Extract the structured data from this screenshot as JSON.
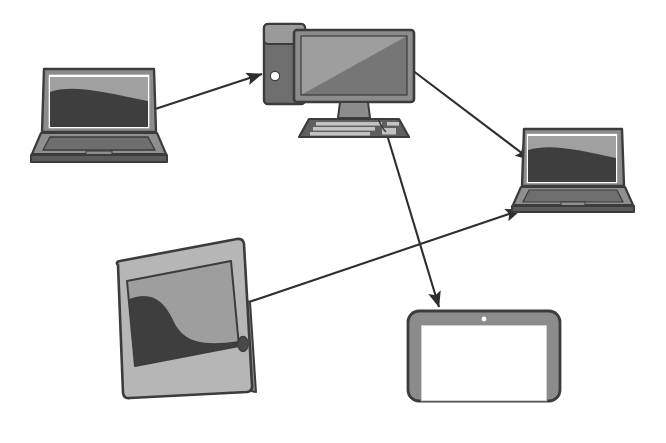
{
  "canvas": {
    "width": 666,
    "height": 443,
    "background": "#ffffff",
    "title": "Device connection diagram"
  },
  "palette": {
    "outline": "#3c3c3c",
    "arrow": "#2e2e2e",
    "bezel_gray": "#8c8c8c",
    "bezel_light": "#b6b6b6",
    "screen_light": "#9e9e9e",
    "screen_dark": "#3e3e3e",
    "screen_blank": "#ffffff",
    "body_dark": "#5b5b5b",
    "body_mid": "#6e6e6e",
    "body_light": "#9a9a9a",
    "key_light": "#c2c2c2",
    "white": "#ffffff"
  },
  "nodes": [
    {
      "id": "laptop-left",
      "type": "laptop",
      "label": "Laptop (left)",
      "screen_style": "wave-dark",
      "x": 36,
      "y": 68,
      "width": 126,
      "height": 92
    },
    {
      "id": "desktop-computer",
      "type": "desktop",
      "label": "Desktop computer with tower, monitor and keyboard",
      "screen_style": "diagonal-split",
      "x": 258,
      "y": 18,
      "width": 160,
      "height": 118
    },
    {
      "id": "laptop-right",
      "type": "laptop",
      "label": "Laptop (right)",
      "screen_style": "wave-dark",
      "x": 516,
      "y": 128,
      "width": 112,
      "height": 84
    },
    {
      "id": "tablet-tilted",
      "type": "tablet-tilted",
      "label": "Tablet (tilted, S-curve screen)",
      "screen_style": "s-curve",
      "x": 113,
      "y": 258,
      "width": 142,
      "height": 140
    },
    {
      "id": "tablet-blank",
      "type": "tablet",
      "label": "Tablet (blank screen)",
      "screen_style": "blank",
      "x": 407,
      "y": 310,
      "width": 153,
      "height": 92
    }
  ],
  "connections": [
    {
      "id": "conn-laptopleft-to-desktop",
      "from": "laptop-left",
      "to": "desktop-computer",
      "x1": 140,
      "y1": 114,
      "x2": 262,
      "y2": 74,
      "arrowhead": "end"
    },
    {
      "id": "conn-desktop-to-laptopright",
      "from": "desktop-computer",
      "to": "laptop-right",
      "x1": 412,
      "y1": 70,
      "x2": 531,
      "y2": 160,
      "arrowhead": "end"
    },
    {
      "id": "conn-desktop-to-tabletblank",
      "from": "desktop-computer",
      "to": "tablet-blank",
      "x1": 385,
      "y1": 128,
      "x2": 439,
      "y2": 307,
      "arrowhead": "end"
    },
    {
      "id": "conn-tablettilted-to-laptopright",
      "from": "tablet-tilted",
      "to": "laptop-right",
      "x1": 246,
      "y1": 303,
      "x2": 521,
      "y2": 210,
      "arrowhead": "end"
    }
  ],
  "icons": {
    "power_button": "power-button-dot",
    "home_button": "tablet-home-button",
    "camera": "tablet-camera-dot",
    "trackpad": "laptop-trackpad",
    "keyboard": "desktop-keyboard"
  }
}
